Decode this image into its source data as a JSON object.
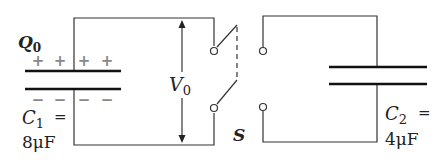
{
  "diagram": {
    "type": "circuit",
    "charge_label": {
      "symbol": "Q",
      "subscript": "0"
    },
    "voltage_label": {
      "symbol": "V",
      "subscript": "0"
    },
    "switch_label": "S",
    "capacitor1": {
      "symbol": "C",
      "subscript": "1",
      "equals": "=",
      "value": "8μF",
      "plus_signs": [
        "+",
        "+",
        "+",
        "+"
      ],
      "minus_signs": [
        "−",
        "−",
        "−",
        "−"
      ]
    },
    "capacitor2": {
      "symbol": "C",
      "subscript": "2",
      "equals": "=",
      "value": "4μF"
    }
  }
}
